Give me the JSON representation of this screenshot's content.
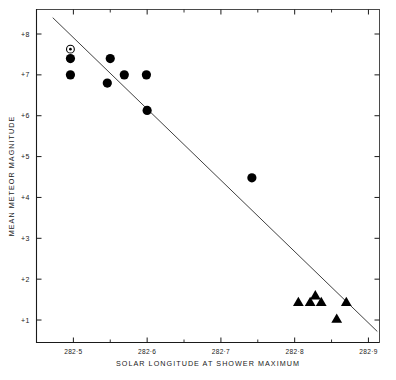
{
  "chart_data": {
    "type": "scatter",
    "title": "",
    "xlabel": "SOLAR LONGITUDE AT SHOWER MAXIMUM",
    "ylabel": "MEAN METEOR MAGNITUDE",
    "xlim": [
      282.45,
      282.915
    ],
    "ylim": [
      0.45,
      8.6
    ],
    "y_inverted": false,
    "grid": false,
    "legend": "none",
    "xticks": [
      282.5,
      282.6,
      282.7,
      282.8,
      282.9
    ],
    "xtick_labels": [
      "282·5",
      "282·6",
      "282·7",
      "282·8",
      "282·9"
    ],
    "x_minor_ticks": [
      282.55,
      282.65,
      282.75,
      282.85
    ],
    "yticks": [
      1,
      2,
      3,
      4,
      5,
      6,
      7,
      8
    ],
    "ytick_labels": [
      "+1",
      "+2",
      "+3",
      "+4",
      "+5",
      "+6",
      "+7",
      "+8"
    ],
    "series": [
      {
        "name": "sun-symbol-point",
        "marker": "circle-with-center-dot",
        "color": "#000000",
        "points": [
          {
            "x": 282.496,
            "y": 7.63
          }
        ]
      },
      {
        "name": "filled-circles",
        "marker": "filled-circle",
        "color": "#000000",
        "points": [
          {
            "x": 282.496,
            "y": 7.4
          },
          {
            "x": 282.496,
            "y": 7.0
          },
          {
            "x": 282.55,
            "y": 7.4
          },
          {
            "x": 282.546,
            "y": 6.8
          },
          {
            "x": 282.569,
            "y": 7.0
          },
          {
            "x": 282.599,
            "y": 7.0
          },
          {
            "x": 282.6,
            "y": 6.13
          },
          {
            "x": 282.742,
            "y": 4.48
          }
        ]
      },
      {
        "name": "filled-triangles",
        "marker": "filled-triangle-up",
        "color": "#000000",
        "points": [
          {
            "x": 282.805,
            "y": 1.44
          },
          {
            "x": 282.821,
            "y": 1.44
          },
          {
            "x": 282.828,
            "y": 1.6
          },
          {
            "x": 282.836,
            "y": 1.44
          },
          {
            "x": 282.857,
            "y": 1.03
          },
          {
            "x": 282.87,
            "y": 1.44
          }
        ]
      }
    ],
    "fit_line": {
      "name": "regression-line",
      "x_start": 282.472,
      "y_start": 8.4,
      "x_end": 282.912,
      "y_end": 0.72,
      "color": "#2a2a2a"
    }
  },
  "axes": {
    "x_axis_title": "SOLAR LONGITUDE AT SHOWER MAXIMUM",
    "y_axis_title": "MEAN METEOR MAGNITUDE"
  }
}
